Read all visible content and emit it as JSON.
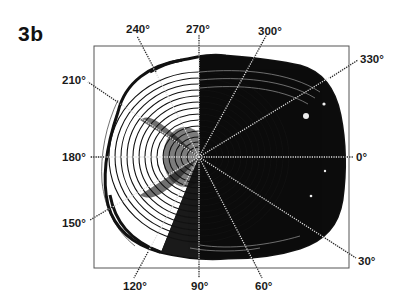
{
  "figure": {
    "panel_label": "3b",
    "frame": {
      "left": 94,
      "top": 46,
      "right": 349,
      "bottom": 268
    },
    "center": {
      "x": 199,
      "y": 157
    },
    "colors": {
      "ink": "#111111",
      "frame": "#555555",
      "background": "#ffffff",
      "ray_dots": "#e8e8e8"
    },
    "radial_labels": [
      {
        "text": "0°",
        "angle": 0,
        "x": 356,
        "y": 152
      },
      {
        "text": "30°",
        "angle": 30,
        "x": 358,
        "y": 260
      },
      {
        "text": "60°",
        "angle": 60,
        "x": 256,
        "y": 279
      },
      {
        "text": "90°",
        "angle": 90,
        "x": 190,
        "y": 279
      },
      {
        "text": "120°",
        "angle": 120,
        "x": 122,
        "y": 279
      },
      {
        "text": "150°",
        "angle": 150,
        "x": 64,
        "y": 221
      },
      {
        "text": "180°",
        "angle": 180,
        "x": 64,
        "y": 152
      },
      {
        "text": "210°",
        "angle": 210,
        "x": 64,
        "y": 76
      },
      {
        "text": "240°",
        "angle": 240,
        "x": 126,
        "y": 24
      },
      {
        "text": "270°",
        "angle": 270,
        "x": 190,
        "y": 24
      },
      {
        "text": "300°",
        "angle": 300,
        "x": 258,
        "y": 24
      },
      {
        "text": "330°",
        "angle": 330,
        "x": 360,
        "y": 55
      }
    ]
  }
}
